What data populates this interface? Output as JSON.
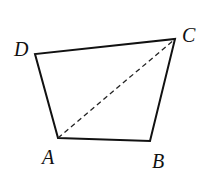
{
  "diagram": {
    "type": "quadrilateral",
    "vertices": [
      {
        "label": "A",
        "x": 58,
        "y": 138,
        "lx": 42,
        "ly": 164
      },
      {
        "label": "B",
        "x": 150,
        "y": 141,
        "lx": 152,
        "ly": 168
      },
      {
        "label": "C",
        "x": 175,
        "y": 39,
        "lx": 182,
        "ly": 42
      },
      {
        "label": "D",
        "x": 35,
        "y": 54,
        "lx": 14,
        "ly": 56
      }
    ],
    "sides": [
      "AB",
      "BC",
      "CD",
      "DA"
    ],
    "dashed_segments": [
      "AC"
    ],
    "stroke_color": "#111111"
  }
}
